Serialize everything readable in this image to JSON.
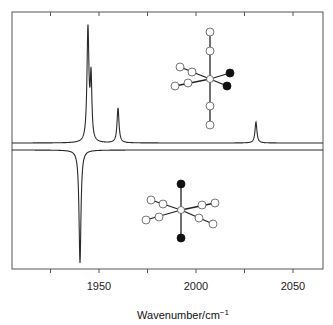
{
  "chart_data": {
    "type": "line",
    "title": "",
    "xlabel": "Wavenumber/cm⁻¹",
    "xlabel_main": "Wavenumber/cm",
    "xlabel_sup": "−1",
    "ylabel": "",
    "xlim": [
      1905,
      2065
    ],
    "xticks_major": [
      1950,
      2000,
      2050
    ],
    "xticks_minor": [
      1925,
      1975,
      2025
    ],
    "xtick_labels": [
      "1950",
      "2000",
      "2050"
    ],
    "grid": false,
    "legend": null,
    "panels": [
      {
        "name": "top-spectrum",
        "orientation": "up",
        "baseline_y_px": 143,
        "peaks": [
          {
            "x": 1944.3,
            "height_px": 113,
            "width": 0.6
          },
          {
            "x": 1945.9,
            "height_px": 62,
            "width": 0.5
          },
          {
            "x": 1959.8,
            "height_px": 35,
            "width": 0.6
          },
          {
            "x": 2030.9,
            "height_px": 21,
            "width": 0.6
          }
        ],
        "inset_molecule": {
          "description": "octahedral complex with two black (trans-adjacent, cis) ligands",
          "center": [
            210,
            79
          ],
          "bonds_white_axial": [
            [
              210,
              32
            ],
            [
              210,
              51
            ],
            [
              210,
              106
            ],
            [
              210,
              125
            ]
          ],
          "white_equatorial": [
            [
              180,
              67
            ],
            [
              192,
              72
            ],
            [
              175,
              86
            ],
            [
              188,
              83
            ]
          ],
          "black_atoms": [
            [
              230,
              73
            ],
            [
              227,
              86
            ]
          ]
        }
      },
      {
        "name": "bottom-spectrum",
        "orientation": "down",
        "baseline_y_px": 150,
        "peaks": [
          {
            "x": 1940.2,
            "height_px": 113,
            "width": 0.6
          }
        ],
        "inset_molecule": {
          "description": "octahedral complex with two black axial (trans) ligands",
          "center": [
            181,
            210
          ],
          "black_atoms": [
            [
              181,
              184
            ],
            [
              181,
              238
            ]
          ],
          "white_left": [
            [
              151,
              200
            ],
            [
              163,
              204
            ],
            [
              146,
              220
            ],
            [
              159,
              217
            ]
          ],
          "white_right": [
            [
              202,
              205
            ],
            [
              215,
              203
            ],
            [
              199,
              218
            ],
            [
              213,
              224
            ]
          ]
        }
      }
    ]
  },
  "colors": {
    "line": "#2a2a2a",
    "frame": "#555555",
    "atom_white_fill": "#ffffff",
    "atom_white_stroke": "#555555",
    "atom_black": "#111111"
  }
}
